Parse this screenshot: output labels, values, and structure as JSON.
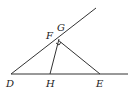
{
  "diagram": {
    "type": "geometry",
    "points": {
      "D": {
        "label": "D",
        "x": 11,
        "y": 74
      },
      "H": {
        "label": "H",
        "x": 50,
        "y": 74
      },
      "E": {
        "label": "E",
        "x": 100,
        "y": 74
      },
      "F": {
        "label": "F",
        "x": 57,
        "y": 41
      },
      "G": {
        "label": "G",
        "x": 58,
        "y": 40
      }
    },
    "segments": [
      {
        "from": "D",
        "to": "ray_end",
        "desc": "ray from D through F/G"
      },
      {
        "from": "D",
        "to": "line_end",
        "desc": "horizontal line through H and E"
      },
      {
        "from": "H",
        "to": "G"
      },
      {
        "from": "E",
        "to": "F"
      }
    ],
    "labels": [
      "D",
      "H",
      "E",
      "F",
      "G"
    ]
  }
}
